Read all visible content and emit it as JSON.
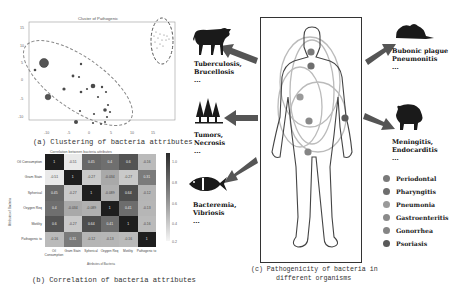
{
  "panel_a": {
    "title": "Cluster of Pathogenic",
    "caption": "(a) Clustering of bacteria attributes",
    "y_ticks": [
      "15",
      "10",
      "5",
      "0",
      "-5",
      "-10"
    ],
    "x_ticks": [
      "-10",
      "-5",
      "0",
      "5",
      "10",
      "15"
    ]
  },
  "panel_b": {
    "title": "Correlation between bacteria attributes",
    "caption": "(b) Correlation of bacteria attributes",
    "ylabel": "Attributes of Bacteria",
    "xlabel": "Attributes of Bacteria",
    "labels": [
      "Oil Consumption",
      "Gram Stain",
      "Spherical",
      "Oxygen Req",
      "Motility",
      "Pathogenic to"
    ],
    "colorbar_ticks": [
      "1.0",
      "0.8",
      "0.6",
      "0.4",
      "0.2"
    ],
    "values": [
      [
        "1",
        "-0.51",
        "0.45",
        "0.4",
        "0.6",
        "-0.16"
      ],
      [
        "-0.51",
        "1",
        "-0.27",
        "-0.034",
        "-0.27",
        "0.31"
      ],
      [
        "0.45",
        "-0.27",
        "1",
        "-0.089",
        "0.64",
        "-0.12"
      ],
      [
        "0.4",
        "-0.034",
        "-0.089",
        "1",
        "0.41",
        "-0.13"
      ],
      [
        "0.6",
        "-0.27",
        "0.64",
        "0.41",
        "1",
        "-0.16"
      ],
      [
        "-0.16",
        "0.31",
        "-0.12",
        "-0.13",
        "-0.16",
        "1"
      ]
    ]
  },
  "panel_c": {
    "caption_line1": "(c) Pathogenicity of bacteria in",
    "caption_line2": "different organisms",
    "organisms": [
      {
        "name": "cattle",
        "line1": "Tuberculosis,",
        "line2": "Brucellosis",
        "more": "..."
      },
      {
        "name": "trees",
        "line1": "Tumors,",
        "line2": "Necrosis",
        "more": "..."
      },
      {
        "name": "fish",
        "line1": "Bacteremia,",
        "line2": "Vibriosis",
        "more": "..."
      },
      {
        "name": "rat",
        "line1": "Bubonic plague",
        "line2": "Pneumonitis",
        "more": "..."
      },
      {
        "name": "pig",
        "line1": "Meningitis,",
        "line2": "Endocarditis",
        "more": "..."
      }
    ],
    "legend": [
      {
        "label": "Periodontal",
        "color": "#7a7a7a"
      },
      {
        "label": "Pharyngitis",
        "color": "#6e6e6e"
      },
      {
        "label": "Pneumonia",
        "color": "#9a9a9a"
      },
      {
        "label": "Gastroenteritis",
        "color": "#8a8a8a"
      },
      {
        "label": "Gonorrhea",
        "color": "#858585"
      },
      {
        "label": "Psoriasis",
        "color": "#5a5a5a"
      }
    ]
  }
}
